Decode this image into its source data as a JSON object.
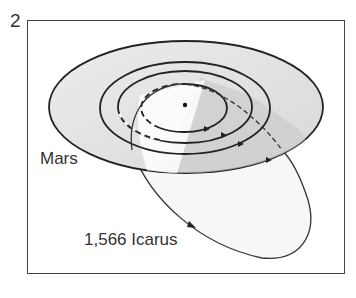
{
  "figure": {
    "number": "2",
    "labels": {
      "planet": "Mars",
      "asteroid": "1,566 Icarus"
    },
    "elements": {
      "sun": "sun-dot",
      "orbits": [
        "inner-orbit-dashed",
        "middle-orbit",
        "mars-orbit",
        "outer-plane-disc"
      ],
      "asteroid_orbit": "icarus-orbit"
    },
    "colors": {
      "line": "#222222",
      "disc_fill": "#e6e6e6",
      "shadow_fill": "#cfcfcf",
      "icarus_fill": "#f6f6f6",
      "frame": "#444444"
    }
  }
}
